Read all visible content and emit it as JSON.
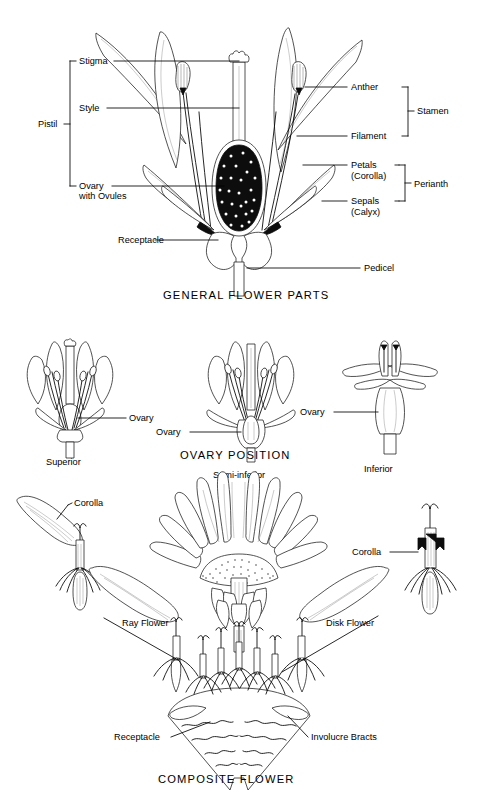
{
  "figure": {
    "kind": "botanical-line-diagram",
    "page_background": "#ffffff",
    "ink_color": "#000000"
  },
  "sections": [
    {
      "id": "general-flower-parts",
      "title": "GENERAL FLOWER PARTS",
      "labels_left": [
        {
          "name": "stigma",
          "text": "Stigma"
        },
        {
          "name": "style",
          "text": "Style"
        },
        {
          "name": "ovary",
          "text": "Ovary"
        },
        {
          "name": "ovary-line2",
          "text": "with  Ovules"
        },
        {
          "name": "receptacle",
          "text": "Receptacle"
        }
      ],
      "brace_left": [
        {
          "name": "pistil",
          "text": "Pistil"
        }
      ],
      "labels_right": [
        {
          "name": "anther",
          "text": "Anther"
        },
        {
          "name": "filament",
          "text": "Filament"
        },
        {
          "name": "petals",
          "text": "Petals"
        },
        {
          "name": "petals-line2",
          "text": "(Corolla)"
        },
        {
          "name": "sepals",
          "text": "Sepals"
        },
        {
          "name": "sepals-line2",
          "text": "(Calyx)"
        },
        {
          "name": "pedicel",
          "text": "Pedicel"
        }
      ],
      "brace_right": [
        {
          "name": "stamen",
          "text": "Stamen"
        },
        {
          "name": "perianth",
          "text": "Perianth"
        }
      ]
    },
    {
      "id": "ovary-position",
      "title": "OVARY POSITION",
      "specimens": [
        {
          "name": "superior",
          "caption": "Superior",
          "callout": "Ovary",
          "callout_side": "right"
        },
        {
          "name": "semi-inferior",
          "caption": "Semi-inferior",
          "callout": "Ovary",
          "callout_side": "left"
        },
        {
          "name": "inferior",
          "caption": "Inferior",
          "callout": "Ovary",
          "callout_side": "left"
        }
      ]
    },
    {
      "id": "composite-flower",
      "title": "COMPOSITE FLOWER",
      "labels": [
        {
          "name": "corolla-ray",
          "text": "Corolla"
        },
        {
          "name": "corolla-disk",
          "text": "Corolla"
        },
        {
          "name": "ray-flower",
          "text": "Ray Flower"
        },
        {
          "name": "disk-flower",
          "text": "Disk Flower"
        },
        {
          "name": "receptacle",
          "text": "Receptacle"
        },
        {
          "name": "involucre-bracts",
          "text": "Involucre Bracts"
        }
      ]
    }
  ]
}
